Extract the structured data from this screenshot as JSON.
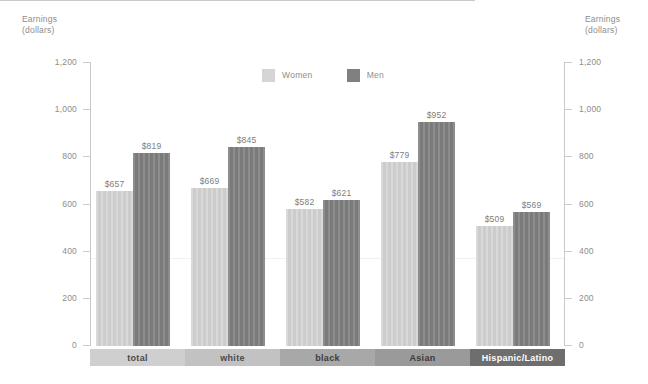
{
  "chart_data": {
    "type": "bar",
    "title": "",
    "xlabel": "",
    "ylabel": "Earnings\n(dollars)",
    "ylabel_right": "Earnings\n(dollars)",
    "ylim": [
      0,
      1200
    ],
    "yticks": [
      0,
      200,
      400,
      600,
      800,
      1000,
      1200
    ],
    "ytick_labels": [
      "0",
      "200",
      "400",
      "600",
      "800",
      "1,000",
      "1,200"
    ],
    "grid": false,
    "legend_position": "top-center",
    "categories": [
      "total",
      "white",
      "black",
      "Asian",
      "Hispanic/Latino"
    ],
    "series": [
      {
        "name": "Women",
        "color": "#d5d5d5",
        "values": [
          657,
          669,
          582,
          779,
          509
        ],
        "labels": [
          "$657",
          "$669",
          "$582",
          "$779",
          "$509"
        ]
      },
      {
        "name": "Men",
        "color": "#808080",
        "values": [
          819,
          845,
          621,
          952,
          569
        ],
        "labels": [
          "$819",
          "$845",
          "$621",
          "$952",
          "$569"
        ]
      }
    ],
    "category_band_colors": [
      "#cfcfcf",
      "#c2c2c2",
      "#a8a8a8",
      "#9a9a9a",
      "#6e6e6e"
    ],
    "category_band_text_colors": [
      "#4a4a4a",
      "#4a4a4a",
      "#3d3d3d",
      "#3a3a3a",
      "#ffffff"
    ]
  },
  "axis": {
    "left_title": "Earnings\n(dollars)",
    "right_title": "Earnings\n(dollars)"
  },
  "legend": {
    "items": [
      {
        "label": "Women",
        "color": "#d5d5d5"
      },
      {
        "label": "Men",
        "color": "#808080"
      }
    ]
  },
  "colors": {
    "background": "#ffffff",
    "axis": "#c9c9c9",
    "tick_text": "#8d8d8d",
    "bar_label_text": "#7d7d7d",
    "women": "#d5d5d5",
    "men": "#808080"
  }
}
